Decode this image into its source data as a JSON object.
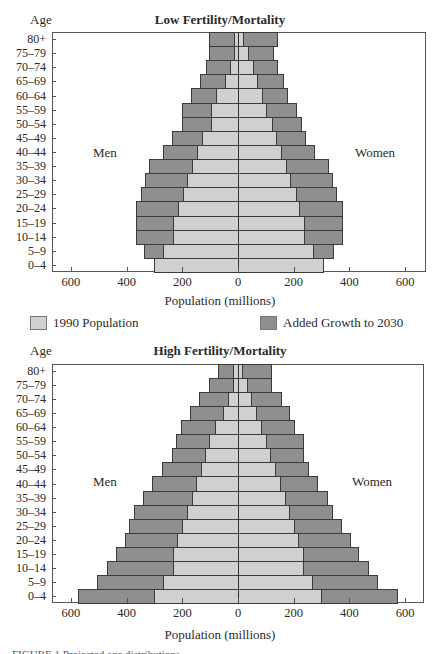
{
  "legend": {
    "items": [
      {
        "label": "1990 Population",
        "color": "#d0d0d0"
      },
      {
        "label": "Added Growth to 2030",
        "color": "#8f8f8f"
      }
    ]
  },
  "caption": "FIGURE 1  Projected age distributions",
  "chart_data": [
    {
      "type": "bar",
      "subtype": "population-pyramid (stacked horizontal)",
      "title": "Low Fertility/Mortality",
      "ylabel": "Age",
      "xlabel": "Population (millions)",
      "side_labels": {
        "left": "Men",
        "right": "Women"
      },
      "xticks": [
        "600",
        "400",
        "200",
        "0",
        "200",
        "400",
        "600"
      ],
      "xlim": [
        -660,
        660
      ],
      "grid": false,
      "legend_position": "below",
      "categories": [
        "80+",
        "75–79",
        "70–74",
        "65–69",
        "60–64",
        "55–59",
        "50–54",
        "45–49",
        "40–44",
        "35–39",
        "30–34",
        "25–29",
        "20–24",
        "15–19",
        "10–14",
        "5–9",
        "0–4"
      ],
      "series": [
        {
          "name": "Men 1990 Population",
          "values": [
            14,
            14,
            29,
            47,
            79,
            97,
            97,
            129,
            147,
            165,
            183,
            198,
            215,
            233,
            233,
            269,
            302
          ]
        },
        {
          "name": "Men 2030 Total (incl. Added Growth)",
          "values": [
            104,
            104,
            115,
            136,
            169,
            200,
            200,
            237,
            269,
            320,
            334,
            348,
            366,
            366,
            366,
            338,
            302
          ]
        },
        {
          "name": "Women 1990 Population",
          "values": [
            18,
            36,
            54,
            68,
            86,
            100,
            122,
            136,
            154,
            172,
            187,
            208,
            219,
            237,
            237,
            269,
            305
          ]
        },
        {
          "name": "Women 2030 Total (incl. Added Growth)",
          "values": [
            140,
            126,
            140,
            162,
            176,
            208,
            226,
            241,
            273,
            323,
            338,
            352,
            373,
            373,
            373,
            341,
            305
          ]
        }
      ]
    },
    {
      "type": "bar",
      "subtype": "population-pyramid (stacked horizontal)",
      "title": "High Fertility/Mortality",
      "ylabel": "Age",
      "xlabel": "Population (millions)",
      "side_labels": {
        "left": "Men",
        "right": "Women"
      },
      "xticks": [
        "600",
        "400",
        "200",
        "0",
        "200",
        "400",
        "600"
      ],
      "xlim": [
        -660,
        660
      ],
      "grid": false,
      "categories": [
        "80+",
        "75–79",
        "70–74",
        "65–69",
        "60–64",
        "55–59",
        "50–54",
        "45–49",
        "40–44",
        "35–39",
        "30–34",
        "25–29",
        "20–24",
        "15–19",
        "10–14",
        "5–9",
        "0–4"
      ],
      "series": [
        {
          "name": "Men 1990 Population",
          "values": [
            18,
            18,
            36,
            54,
            83,
            104,
            118,
            133,
            151,
            165,
            183,
            201,
            219,
            233,
            233,
            269,
            302
          ]
        },
        {
          "name": "Men 2030 Total (incl. Added Growth)",
          "values": [
            72,
            104,
            140,
            172,
            205,
            223,
            237,
            272,
            308,
            341,
            373,
            391,
            405,
            438,
            470,
            506,
            574
          ]
        },
        {
          "name": "Women 1990 Population",
          "values": [
            14,
            32,
            47,
            65,
            83,
            100,
            115,
            133,
            151,
            169,
            183,
            201,
            215,
            233,
            233,
            266,
            298
          ]
        },
        {
          "name": "Women 2030 Total (incl. Added Growth)",
          "values": [
            119,
            119,
            154,
            183,
            201,
            233,
            233,
            251,
            284,
            320,
            338,
            370,
            402,
            431,
            467,
            499,
            571
          ]
        }
      ]
    }
  ]
}
